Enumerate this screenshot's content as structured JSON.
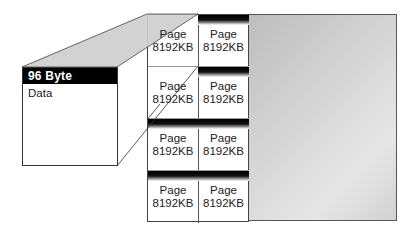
{
  "diagram": {
    "header_box": {
      "header_label": "96 Byte Header",
      "body_label": "Data"
    },
    "pages": [
      {
        "line1": "Page",
        "line2": "8192KB"
      },
      {
        "line1": "Page",
        "line2": "8192KB"
      },
      {
        "line1": "Page",
        "line2": "8192KB"
      },
      {
        "line1": "Page",
        "line2": "8192KB"
      },
      {
        "line1": "Page",
        "line2": "8192KB"
      },
      {
        "line1": "Page",
        "line2": "8192KB"
      },
      {
        "line1": "Page",
        "line2": "8192KB"
      },
      {
        "line1": "Page",
        "line2": "8192KB"
      }
    ],
    "colors": {
      "header_bg": "#000000",
      "header_text": "#ffffff",
      "top_face": "#cfcfcf",
      "panel_gray": "#d6d6d6",
      "line": "#333333"
    }
  }
}
